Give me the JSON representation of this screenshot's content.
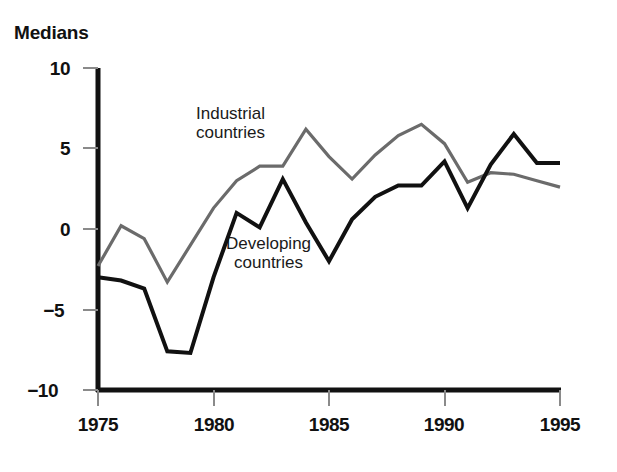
{
  "chart_data": {
    "type": "line",
    "title": "Medians",
    "xlabel": "",
    "ylabel": "",
    "xlim": [
      1975,
      1995
    ],
    "ylim": [
      -10,
      10
    ],
    "x_ticks": [
      1975,
      1980,
      1985,
      1990,
      1995
    ],
    "y_ticks": [
      10,
      5,
      0,
      -5,
      -10
    ],
    "x_tick_labels": [
      "1975",
      "1980",
      "1985",
      "1990",
      "1995"
    ],
    "y_tick_labels": [
      "10",
      "5",
      "0",
      "−5",
      "−10"
    ],
    "grid": false,
    "legend": "inline-annotations",
    "series": [
      {
        "name": "Industrial countries",
        "color": "#6b6b6b",
        "annotation": "Industrial\ncountries",
        "x": [
          1975,
          1976,
          1977,
          1978,
          1979,
          1980,
          1981,
          1982,
          1983,
          1984,
          1985,
          1986,
          1987,
          1988,
          1989,
          1990,
          1991,
          1992,
          1993,
          1994,
          1995
        ],
        "values": [
          -2.3,
          0.2,
          -0.6,
          -3.3,
          -1.0,
          1.3,
          3.0,
          3.9,
          3.9,
          6.2,
          4.5,
          3.1,
          4.6,
          5.8,
          6.5,
          5.3,
          2.9,
          3.5,
          3.4,
          3.0,
          2.6
        ]
      },
      {
        "name": "Developing countries",
        "color": "#111111",
        "annotation": "Developing\ncountries",
        "x": [
          1975,
          1976,
          1977,
          1978,
          1979,
          1980,
          1981,
          1982,
          1983,
          1984,
          1985,
          1986,
          1987,
          1988,
          1989,
          1990,
          1991,
          1992,
          1993,
          1994,
          1995
        ],
        "values": [
          -3.0,
          -3.2,
          -3.7,
          -7.6,
          -7.7,
          -3.0,
          1.0,
          0.1,
          3.1,
          0.4,
          -2.0,
          0.6,
          2.0,
          2.7,
          2.7,
          4.2,
          1.3,
          4.0,
          5.9,
          4.1,
          4.1
        ]
      }
    ]
  },
  "axes": {
    "y_axis_name": "vertical-value-axis",
    "x_axis_name": "horizontal-year-axis"
  }
}
